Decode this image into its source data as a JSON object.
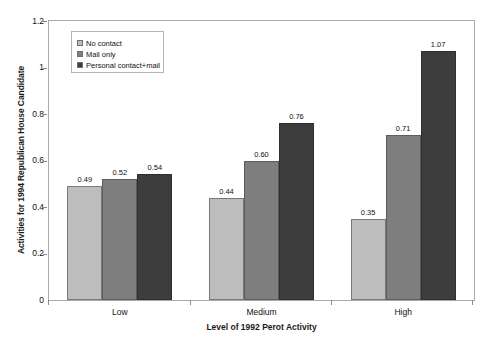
{
  "chart_data": {
    "type": "bar",
    "title": "",
    "xlabel": "Level of 1992 Perot Activity",
    "ylabel": "Activities for 1994 Republican House Candidate",
    "categories": [
      "Low",
      "Medium",
      "High"
    ],
    "series": [
      {
        "name": "No contact",
        "values": [
          0.49,
          0.44,
          0.35
        ],
        "color": "#bdbdbd"
      },
      {
        "name": "Mail only",
        "values": [
          0.52,
          0.6,
          0.71
        ],
        "color": "#7e7e7e"
      },
      {
        "name": "Personal contact+mail",
        "values": [
          0.54,
          0.76,
          1.07
        ],
        "color": "#3d3d3d"
      }
    ],
    "value_labels": [
      [
        "0.49",
        "0.52",
        "0.54"
      ],
      [
        "0.44",
        "0.60",
        "0.76"
      ],
      [
        "0.35",
        "0.71",
        "1.07"
      ]
    ],
    "ylim": [
      0,
      1.2
    ],
    "yticks": [
      0,
      0.2,
      0.4,
      0.6,
      0.8,
      1,
      1.2
    ],
    "ytick_labels": [
      "0",
      "0.2",
      "0.4",
      "0.6",
      "0.8",
      "1",
      "1.2"
    ],
    "grid": false,
    "legend_position": "top-left",
    "bar_gap_between_groups": true
  }
}
